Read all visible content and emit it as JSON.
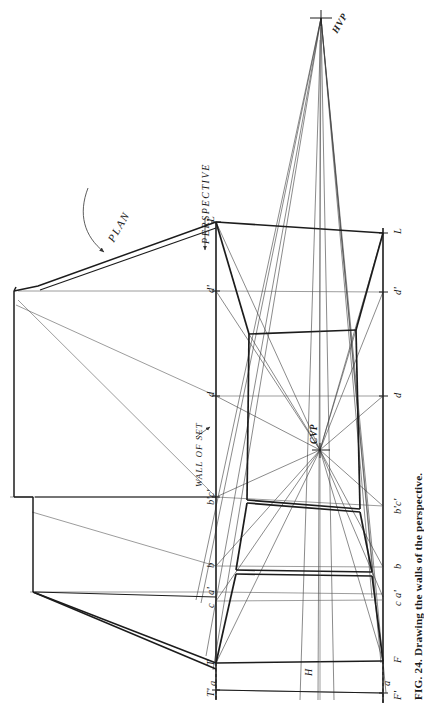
{
  "figure": {
    "caption": "FIG. 24. Drawing the walls of the perspective.",
    "orientation": "rotated-90-ccw",
    "annotations": {
      "plan": "PLAN",
      "perspective": "PERSPECTIVE",
      "wall_of_set": "WALL OF SET"
    },
    "vanishing_points": {
      "hvp": "HVP",
      "cvp": "CVP"
    },
    "horizon_label": "H",
    "left_scale_labels": [
      "L",
      "d'",
      "d",
      "b'c'",
      "b",
      "a'",
      "c",
      "T",
      "T'",
      "a"
    ],
    "right_scale_labels": [
      "L",
      "d'",
      "d",
      "b'c'",
      "b",
      "c a'",
      "F",
      "a",
      "F'"
    ],
    "left_points": [
      {
        "id": "L",
        "label": "L",
        "y": 222
      },
      {
        "id": "dp",
        "label": "d'",
        "y": 291
      },
      {
        "id": "d",
        "label": "d",
        "y": 396
      },
      {
        "id": "bpcp",
        "label": "b'c'",
        "y": 497
      },
      {
        "id": "b",
        "label": "b",
        "y": 566
      },
      {
        "id": "ap",
        "label": "a'",
        "y": 592
      },
      {
        "id": "c",
        "label": "c",
        "y": 601
      },
      {
        "id": "T",
        "label": "T",
        "y": 663
      },
      {
        "id": "Tp",
        "label": "T'",
        "y": 690
      },
      {
        "id": "a",
        "label": "a",
        "y": 681
      }
    ],
    "right_points": [
      {
        "id": "L",
        "label": "L",
        "y": 233
      },
      {
        "id": "dp",
        "label": "d'",
        "y": 292
      },
      {
        "id": "d",
        "label": "d",
        "y": 396
      },
      {
        "id": "bpcp",
        "label": "b'c'",
        "y": 506
      },
      {
        "id": "b",
        "label": "b",
        "y": 567
      },
      {
        "id": "cap",
        "label": "c a'",
        "y": 597
      },
      {
        "id": "F",
        "label": "F",
        "y": 661
      },
      {
        "id": "a",
        "label": "a",
        "y": 681
      },
      {
        "id": "Fp",
        "label": "F'",
        "y": 693
      }
    ],
    "colors": {
      "line": "#1c1c1c",
      "thin_line": "#4a4a4a",
      "paper": "#ffffff"
    }
  }
}
